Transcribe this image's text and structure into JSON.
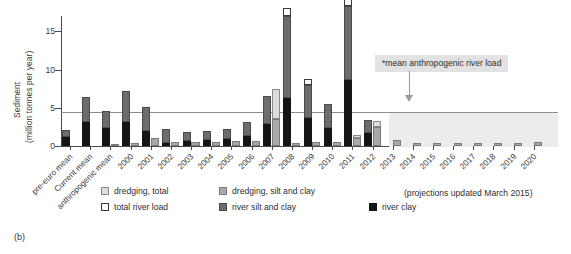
{
  "panel_label": "(b)",
  "annotation": {
    "text": "*mean anthropogenic river load"
  },
  "projection_note": "(projections updated March 2015)",
  "legend": {
    "items": [
      {
        "label": "dredging, total",
        "key": "dredge-total",
        "color": "#dcdcdc"
      },
      {
        "label": "dredging, silt and clay",
        "key": "dredge-silt",
        "color": "#a8a8a8"
      },
      {
        "label": "total river load",
        "key": "river-total",
        "color": "#ffffff"
      },
      {
        "label": "river silt and clay",
        "key": "river-silt",
        "color": "#6d6d6d"
      },
      {
        "label": "river clay",
        "key": "river-clay",
        "color": "#151515"
      }
    ]
  },
  "chart_data": {
    "type": "bar",
    "title": "",
    "subtitle": "",
    "xlabel": "",
    "ylabel": "Sediment (million tonnes per year)",
    "ylabel_line1": "Sediment",
    "ylabel_line2": "(million tonnes per year)",
    "ylim": [
      0,
      17
    ],
    "yticks": [
      0,
      5,
      10,
      15
    ],
    "ytick_labels": [
      "0",
      "5",
      "10",
      "15"
    ],
    "grid": false,
    "legend_position": "below-left",
    "reference_lines": [
      {
        "label": "*mean anthropogenic river load",
        "value": 4.5,
        "color": "#8d8d8d"
      }
    ],
    "shaded_region": {
      "label": "projection period",
      "x_from": "2013",
      "x_to": "2020",
      "y_top": 4.5,
      "color": "#ececec"
    },
    "categories": [
      "pre-euro mean",
      "Current mean",
      "anthropogenic mean",
      "2000",
      "2001",
      "2002",
      "2003",
      "2004",
      "2005",
      "2006",
      "2007",
      "2008",
      "2009",
      "2010",
      "2011",
      "2012",
      "2013",
      "2014",
      "2015",
      "2016",
      "2017",
      "2018",
      "2019",
      "2020"
    ],
    "series": [
      {
        "name": "river clay",
        "color": "#151515",
        "values": [
          1.2,
          3.1,
          2.3,
          3.1,
          2.0,
          0.45,
          0.6,
          0.75,
          0.9,
          1.3,
          2.9,
          6.3,
          3.6,
          2.4,
          8.6,
          1.7,
          0,
          0,
          0,
          0,
          0,
          0,
          0,
          0
        ]
      },
      {
        "name": "river silt and clay",
        "color": "#6d6d6d",
        "values": [
          2.1,
          6.4,
          4.6,
          7.2,
          5.1,
          2.2,
          1.8,
          1.9,
          2.2,
          3.1,
          6.5,
          17.0,
          8.0,
          5.5,
          18.3,
          3.4,
          0,
          0,
          0,
          0,
          0,
          0,
          0,
          0
        ]
      },
      {
        "name": "total river load",
        "color": "#ffffff",
        "values": [
          2.1,
          6.4,
          4.6,
          7.2,
          5.1,
          2.2,
          1.8,
          1.9,
          2.2,
          3.1,
          6.5,
          18.0,
          8.8,
          5.5,
          19.2,
          3.4,
          0,
          0,
          0,
          0,
          0,
          0,
          0,
          0
        ]
      },
      {
        "name": "dredging, silt and clay",
        "color": "#a8a8a8",
        "values": [
          0,
          0,
          0.3,
          0.35,
          1.1,
          0.5,
          0.5,
          0.55,
          0.6,
          0.7,
          3.5,
          0.45,
          0.5,
          0.5,
          1.1,
          2.5,
          0.8,
          0.45,
          0.35,
          0.4,
          0.4,
          0.4,
          0.4,
          0.5
        ]
      },
      {
        "name": "dredging, total",
        "color": "#dcdcdc",
        "values": [
          0,
          0,
          0.3,
          0.35,
          1.1,
          0.5,
          0.5,
          0.55,
          0.6,
          0.7,
          7.5,
          0.45,
          0.5,
          0.5,
          1.5,
          3.3,
          0.8,
          0.45,
          0.35,
          0.4,
          0.4,
          0.4,
          0.4,
          0.5
        ]
      }
    ],
    "notes": [
      "Each year shows two adjacent bars: a river-load bar (clay, silt and clay, total) and a dredging bar (silt and clay, total).",
      "Values after 2012 are projections."
    ]
  }
}
